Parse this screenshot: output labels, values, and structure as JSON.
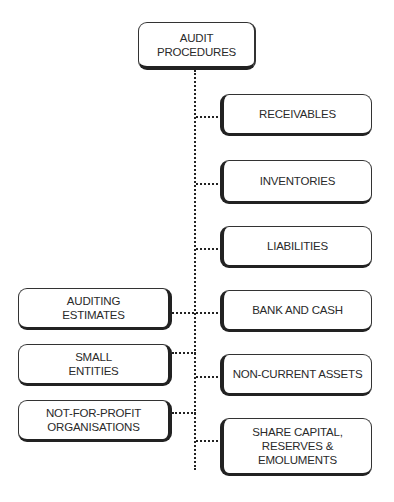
{
  "diagram": {
    "title": "AUDIT\nPROCEDURES",
    "right_branches": [
      {
        "label": "RECEIVABLES"
      },
      {
        "label": "INVENTORIES"
      },
      {
        "label": "LIABILITIES"
      },
      {
        "label": "BANK AND CASH"
      },
      {
        "label": "NON-CURRENT ASSETS"
      },
      {
        "label": "SHARE CAPITAL,\nRESERVES &\nEMOLUMENTS"
      }
    ],
    "left_branches": [
      {
        "label": "AUDITING\nESTIMATES"
      },
      {
        "label": "SMALL\nENTITIES"
      },
      {
        "label": "NOT-FOR-PROFIT\nORGANISATIONS"
      }
    ],
    "colors": {
      "stroke": "#222222",
      "text": "#2a2a2a",
      "background": "#ffffff"
    }
  }
}
